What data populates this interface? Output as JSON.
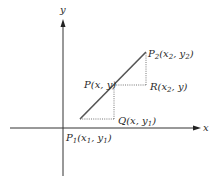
{
  "diagram": {
    "axes": {
      "x_label": "x",
      "y_label": "y"
    },
    "points": {
      "P1": {
        "name": "P",
        "sub": "1",
        "args": [
          "x",
          "1",
          "y",
          "1"
        ],
        "text": "P1(x1, y1)"
      },
      "P2": {
        "name": "P",
        "sub": "2",
        "args": [
          "x",
          "2",
          "y",
          "2"
        ],
        "text": "P2(x2, y2)"
      },
      "P": {
        "name": "P",
        "text": "P(x, y)"
      },
      "R": {
        "name": "R",
        "text": "R(x2, y)"
      },
      "Q": {
        "name": "Q",
        "text": "Q(x, y1)"
      }
    },
    "colors": {
      "line": "#555555",
      "axis": "#333333",
      "dotted": "#666666"
    }
  }
}
